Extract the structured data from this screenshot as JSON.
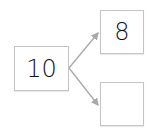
{
  "diagram": {
    "type": "number-bond",
    "whole": {
      "value": "10"
    },
    "parts": [
      {
        "value": "8"
      },
      {
        "value": ""
      }
    ],
    "colors": {
      "border": "#c4c4c4",
      "arrow": "#a8a8a8",
      "text": "#111111"
    }
  }
}
